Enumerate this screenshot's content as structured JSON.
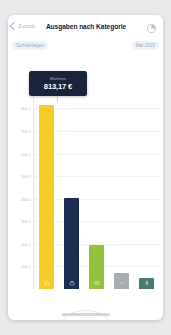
{
  "navbar": {
    "back_label": "Zurück",
    "title": "Ausgaben nach Kategorie",
    "chart_toggle_icon": "pie-chart-icon"
  },
  "filters": {
    "account_chip": "Sichteinlagen",
    "period_chip": "Mai 2020"
  },
  "tooltip": {
    "label": "Wohnen",
    "value": "813,17 €"
  },
  "colors": {
    "bar_housing": "#f5cd2a",
    "bar_shopping": "#1d2c52",
    "bar_leisure": "#93c23c",
    "bar_other": "#a9acaf",
    "bar_health": "#4a7a72",
    "tooltip_bg": "#19233a",
    "chip_bg": "#eef3fa",
    "chip_text": "#93a9c8",
    "title": "#11233f",
    "gridline": "#f0f1f3",
    "axis_text": "#b9bcc4"
  },
  "chart_data": {
    "type": "bar",
    "title": "Ausgaben nach Kategorie",
    "xlabel": "",
    "ylabel": "",
    "ylim": [
      0,
      850
    ],
    "grid": true,
    "legend": "none",
    "currency": "€",
    "ticks": [
      "800 €",
      "700 €",
      "600 €",
      "500 €",
      "400 €",
      "300 €",
      "200 €",
      "100 €"
    ],
    "tick_values": [
      800,
      700,
      600,
      500,
      400,
      300,
      200,
      100
    ],
    "categories": [
      "Wohnen",
      "Shopping",
      "Freizeit",
      "Sonstiges",
      "Gesundheit"
    ],
    "icons": [
      "home-icon",
      "shopping-bag-icon",
      "ticket-icon",
      "dots-icon",
      "pill-icon"
    ],
    "values": [
      813.17,
      402,
      195,
      72,
      48
    ],
    "value_labels": [
      "813,17 €",
      "402 €",
      "195 €",
      "72 €",
      "48 €"
    ],
    "selected_index": 0,
    "annotations": [
      {
        "category": "Wohnen",
        "text": "813,17 €"
      }
    ]
  }
}
